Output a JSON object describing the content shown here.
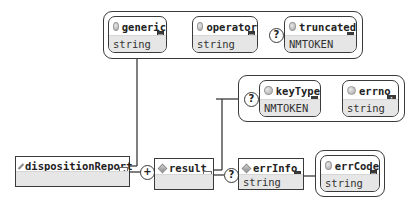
{
  "diagram": {
    "type": "xml-schema-diagram",
    "root_element": {
      "name": "dispositionReport",
      "type": "",
      "expandable": true
    },
    "root_attributes": [
      {
        "name": "generic",
        "type": "string",
        "optional": false,
        "badge": "list-icon"
      },
      {
        "name": "operator",
        "type": "string",
        "optional": false,
        "badge": "list-icon"
      },
      {
        "name": "truncated",
        "type": "NMTOKEN",
        "optional": true,
        "badge": "enum-icon"
      }
    ],
    "sequence_connector": {
      "symbol": "+",
      "meaning": "one-or-more"
    },
    "result_element": {
      "name": "result",
      "type": "",
      "expandable": true
    },
    "result_attributes": [
      {
        "name": "keyType",
        "type": "NMTOKEN",
        "optional": true,
        "badge": "enum-icon"
      },
      {
        "name": "errno",
        "type": "string",
        "optional": false,
        "badge": "info-icon",
        "badge_text": "i"
      }
    ],
    "errinfo_connector": {
      "symbol": "?",
      "meaning": "optional"
    },
    "errinfo_element": {
      "name": "errInfo",
      "type": "string"
    },
    "errinfo_attributes": [
      {
        "name": "errCode",
        "type": "string",
        "optional": false,
        "badge": "list-icon"
      }
    ],
    "optional_symbol": "?"
  }
}
